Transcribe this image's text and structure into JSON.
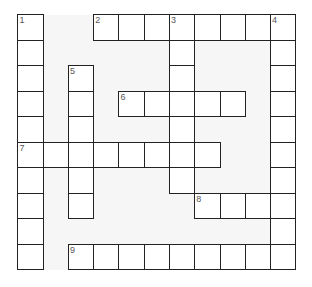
{
  "puzzle": {
    "cols": 11,
    "rows": 10,
    "cell_w": 25.27,
    "cell_h": 25.5,
    "colors": {
      "background": "#ffffff",
      "grid_bg": "#f6f6f6",
      "cell": "#ffffff",
      "border": "#222222",
      "number": "#555555"
    },
    "words": [
      {
        "number": "1",
        "direction": "down",
        "row": 0,
        "col": 0,
        "length": 10
      },
      {
        "number": "2",
        "direction": "across",
        "row": 0,
        "col": 3,
        "length": 8
      },
      {
        "number": "3",
        "direction": "down",
        "row": 0,
        "col": 6,
        "length": 7
      },
      {
        "number": "4",
        "direction": "down",
        "row": 0,
        "col": 10,
        "length": 10
      },
      {
        "number": "5",
        "direction": "down",
        "row": 2,
        "col": 2,
        "length": 6
      },
      {
        "number": "6",
        "direction": "across",
        "row": 3,
        "col": 4,
        "length": 5
      },
      {
        "number": "7",
        "direction": "across",
        "row": 5,
        "col": 0,
        "length": 8
      },
      {
        "number": "8",
        "direction": "across",
        "row": 7,
        "col": 7,
        "length": 4
      },
      {
        "number": "9",
        "direction": "across",
        "row": 9,
        "col": 2,
        "length": 9
      }
    ]
  }
}
